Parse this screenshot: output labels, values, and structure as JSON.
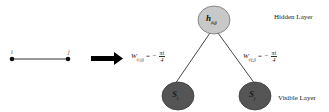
{
  "left_graph": {
    "node_i_label": "i",
    "node_j_label": "j"
  },
  "arrow": "right-arrow",
  "hidden_node": {
    "symbol": "h",
    "subscript": "(i,j)",
    "fill": "#c8c8c8"
  },
  "visible_nodes": [
    {
      "symbol": "S",
      "subscript": "i",
      "fill": "#555555"
    },
    {
      "symbol": "S",
      "subscript": "j",
      "fill": "#555555"
    }
  ],
  "weights": [
    {
      "symbol": "W",
      "subscript": "(i,ij)",
      "sign": "= −",
      "numerator": "πi",
      "denominator": "4"
    },
    {
      "symbol": "W",
      "subscript": "(ij,j)",
      "sign": "= −",
      "numerator": "πi",
      "denominator": "4"
    }
  ],
  "layers": {
    "hidden": "Hidden Layer",
    "visible": "Visible Layer"
  }
}
